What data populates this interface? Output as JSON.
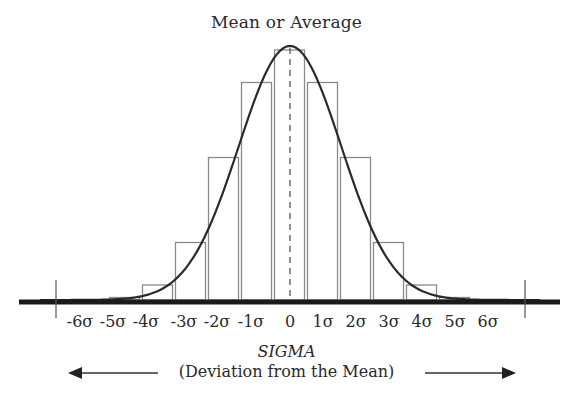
{
  "title": "Mean or Average",
  "axis": {
    "title": "SIGMA",
    "subtitle": "(Deviation from the Mean)",
    "tick_labels": [
      "-6σ",
      "-5σ",
      "-4σ",
      "-3σ",
      "-2σ",
      "-1σ",
      "0",
      "1σ",
      "2σ",
      "3σ",
      "4σ",
      "5σ",
      "6σ"
    ]
  },
  "icons": {
    "left_arrow": "arrow-left-icon",
    "right_arrow": "arrow-right-icon"
  },
  "colors": {
    "curve": "#2a2a2a",
    "bars": "#8a8a8a",
    "baseline": "#1a1a1a",
    "background": "#ffffff"
  },
  "chart_data": {
    "type": "bar",
    "title": "Mean or Average",
    "xlabel": "SIGMA (Deviation from the Mean)",
    "ylabel": "",
    "categories": [
      "-5σ",
      "-4σ",
      "-3σ",
      "-2σ",
      "-1σ",
      "0",
      "1σ",
      "2σ",
      "3σ",
      "4σ",
      "5σ"
    ],
    "values": [
      1,
      6,
      23,
      57,
      87,
      100,
      87,
      57,
      23,
      6,
      1
    ],
    "overlay": "normal distribution bell curve centered at 0 (mean shown as dashed vertical line)",
    "xlim": [
      "-6σ",
      "6σ"
    ],
    "grid": false,
    "legend": "none"
  }
}
